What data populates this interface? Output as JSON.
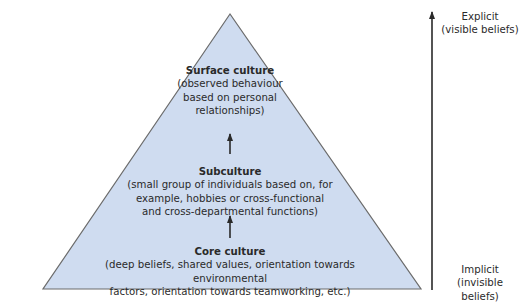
{
  "diagram": {
    "type": "pyramid",
    "fill_color": "#cfdcf0",
    "stroke_color": "#6b6b6b",
    "layers": [
      {
        "title": "Surface culture",
        "description": "(observed behaviour based on personal relationships)",
        "lines": [
          "(observed behaviour",
          "based on personal",
          "relationships)"
        ]
      },
      {
        "title": "Subculture",
        "description": "(small group of individuals based on, for example, hobbies or cross-functional and cross-departmental functions)",
        "lines": [
          "(small group of individuals based on, for",
          "example, hobbies or cross-functional",
          "and cross-departmental functions)"
        ]
      },
      {
        "title": "Core culture",
        "description": "(deep beliefs, shared values, orientation towards environmental factors, orientation towards teamworking, etc.)",
        "lines": [
          "(deep beliefs, shared values, orientation towards environmental",
          "factors, orientation towards teamworking, etc.)"
        ]
      }
    ],
    "axis": {
      "top_label": "Explicit",
      "top_sublabel": "(visible beliefs)",
      "bottom_label": "Implicit",
      "bottom_sublabel": "(invisible beliefs)"
    }
  }
}
